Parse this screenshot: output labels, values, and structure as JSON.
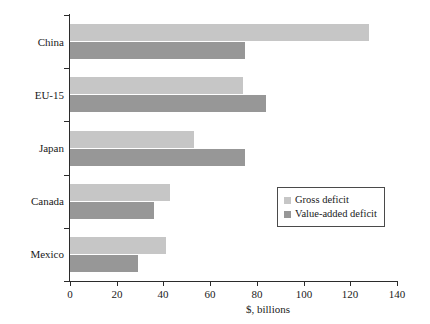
{
  "chart_data": {
    "type": "bar",
    "orientation": "horizontal",
    "title": "",
    "xlabel": "$, billions",
    "ylabel": "",
    "categories": [
      "China",
      "EU-15",
      "Japan",
      "Canada",
      "Mexico"
    ],
    "series": [
      {
        "name": "Gross deficit",
        "color": "#c6c6c6",
        "values": [
          128,
          74,
          53,
          43,
          41
        ]
      },
      {
        "name": "Value-added deficit",
        "color": "#979797",
        "values": [
          75,
          84,
          75,
          36,
          29
        ]
      }
    ],
    "xlim": [
      0,
      140
    ],
    "xticks": [
      0,
      20,
      40,
      60,
      80,
      100,
      120,
      140
    ],
    "xtick_labels": [
      "0",
      "20",
      "40",
      "60",
      "80",
      "100",
      "120",
      "140"
    ],
    "grid": false,
    "legend_position": "center-right"
  },
  "legend": {
    "entries": [
      {
        "label": "Gross deficit"
      },
      {
        "label": "Value-added deficit"
      }
    ]
  },
  "axis": {
    "x_title": "$, billions"
  }
}
